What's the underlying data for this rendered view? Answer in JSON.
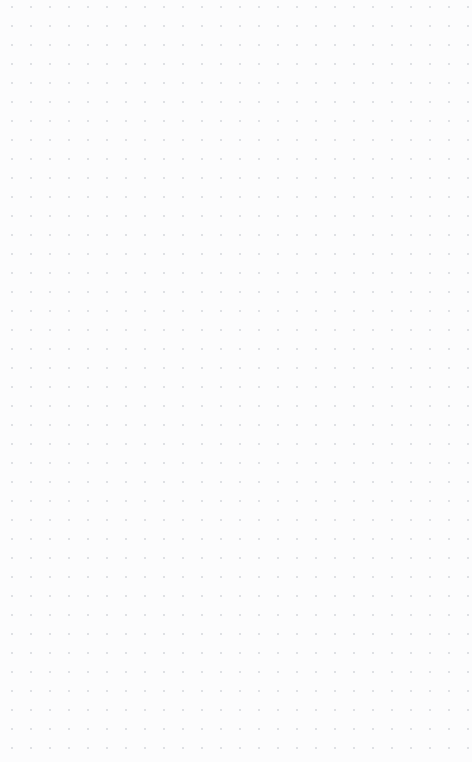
{
  "app": {
    "surface_name": "canvas",
    "width": 472,
    "height": 762
  },
  "canvas": {
    "background_color": "#fcfcfd",
    "is_empty": true,
    "objects": [],
    "grid": {
      "type": "dot",
      "visible": true,
      "dot_color": "#b9bdc5",
      "dot_size": 1.6,
      "spacing_x": 19,
      "spacing_y": 19,
      "offset_x": 12,
      "offset_y": 7,
      "columns": 25,
      "rows": 40
    }
  }
}
